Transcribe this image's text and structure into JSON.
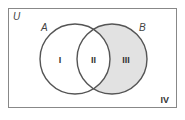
{
  "diagram": {
    "type": "venn",
    "universe_label": "U",
    "sets": [
      {
        "label": "A"
      },
      {
        "label": "B"
      }
    ],
    "regions": [
      {
        "label": "I",
        "description": "A only",
        "shaded": false
      },
      {
        "label": "II",
        "description": "A and B",
        "shaded": false
      },
      {
        "label": "III",
        "description": "B only",
        "shaded": true
      },
      {
        "label": "IV",
        "description": "neither A nor B",
        "shaded": false
      }
    ],
    "colors": {
      "shade": "#e2e2e2",
      "stroke": "#555555",
      "frame": "#888888"
    }
  }
}
